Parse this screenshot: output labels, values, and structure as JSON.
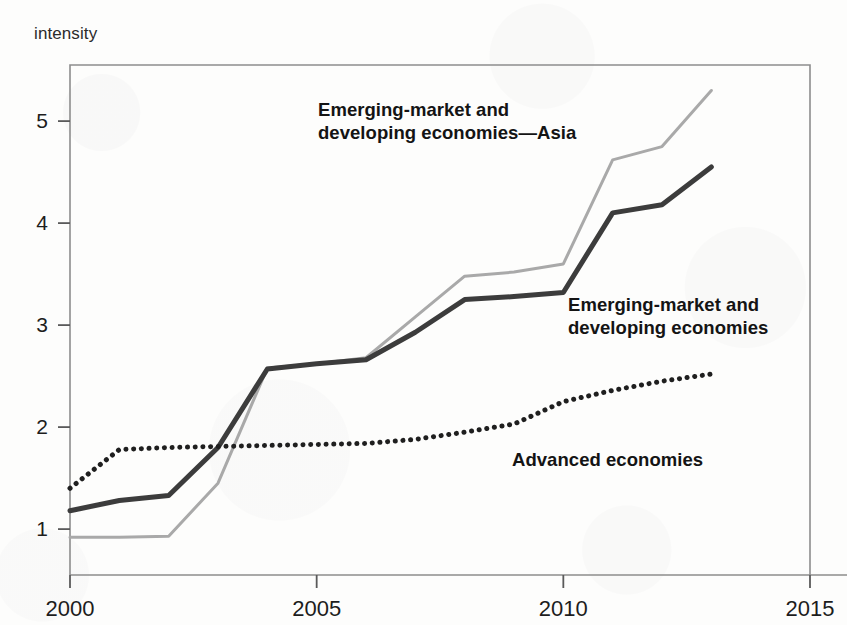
{
  "figure": {
    "y_axis_caption": "intensity"
  },
  "chart_data": {
    "type": "line",
    "title": "",
    "xlabel": "",
    "ylabel": "intensity",
    "xlim": [
      2000,
      2015
    ],
    "ylim": [
      0.55,
      5.55
    ],
    "grid": false,
    "legend_position": "inline-annotations",
    "x_ticks": [
      "2000",
      "2005",
      "2010",
      "2015"
    ],
    "x_tick_values": [
      2000,
      2005,
      2010,
      2015
    ],
    "y_ticks": [
      "1",
      "2",
      "3",
      "4",
      "5"
    ],
    "y_tick_values": [
      1,
      2,
      3,
      4,
      5
    ],
    "x": [
      2000,
      2001,
      2002,
      2003,
      2004,
      2005,
      2006,
      2007,
      2008,
      2009,
      2010,
      2011,
      2012,
      2013
    ],
    "series": [
      {
        "name": "Emerging-market and developing economies—Asia",
        "style": "solid",
        "color": "#a9a9a9",
        "width": 3,
        "label_lines": [
          "Emerging-market and",
          "developing economies—Asia"
        ],
        "label_x": 318,
        "label_y": 116,
        "values": [
          0.92,
          0.92,
          0.93,
          1.45,
          2.58,
          2.62,
          2.68,
          3.08,
          3.48,
          3.52,
          3.6,
          4.62,
          4.75,
          5.3
        ]
      },
      {
        "name": "Emerging-market and developing economies",
        "style": "solid",
        "color": "#3c3c3c",
        "width": 5,
        "label_lines": [
          "Emerging-market and",
          "developing economies"
        ],
        "label_x": 568,
        "label_y": 311,
        "values": [
          1.18,
          1.28,
          1.33,
          1.8,
          2.57,
          2.62,
          2.66,
          2.93,
          3.25,
          3.28,
          3.32,
          4.1,
          4.18,
          4.55
        ]
      },
      {
        "name": "Advanced economies",
        "style": "dotted",
        "color": "#1f1f1f",
        "width": 5,
        "label_lines": [
          "Advanced economies"
        ],
        "label_x": 512,
        "label_y": 466,
        "values": [
          1.4,
          1.78,
          1.8,
          1.81,
          1.82,
          1.83,
          1.84,
          1.88,
          1.95,
          2.03,
          2.25,
          2.36,
          2.45,
          2.52
        ]
      }
    ]
  }
}
